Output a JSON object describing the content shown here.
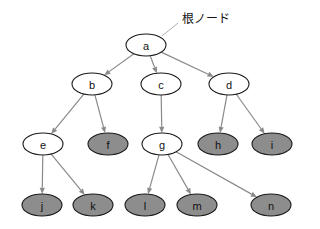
{
  "figure": {
    "kind": "tree-diagram",
    "width": 320,
    "height": 229,
    "background_color": "#ffffff"
  },
  "colors": {
    "node_outline": "#1a1a1a",
    "node_fill_white": "#ffffff",
    "node_fill_gray": "#8d8d8d",
    "edge": "#8a8a8a",
    "leader_line": "#a6a6a6",
    "text": "#111111"
  },
  "annotations": [
    {
      "id": "root-annotation",
      "text": "根ノード",
      "x": 182,
      "y": 20,
      "leader_from_x": 162,
      "leader_from_y": 36,
      "leader_to_x": 178,
      "leader_to_y": 23,
      "points_to_node": "a"
    }
  ],
  "nodes": [
    {
      "id": "a",
      "label": "a",
      "x": 146,
      "y": 45,
      "rx": 20,
      "ry": 11,
      "fill": "white",
      "level": 0
    },
    {
      "id": "b",
      "label": "b",
      "x": 92,
      "y": 84,
      "rx": 20,
      "ry": 11,
      "fill": "white",
      "level": 1
    },
    {
      "id": "c",
      "label": "c",
      "x": 161,
      "y": 84,
      "rx": 20,
      "ry": 11,
      "fill": "white",
      "level": 1
    },
    {
      "id": "d",
      "label": "d",
      "x": 229,
      "y": 84,
      "rx": 20,
      "ry": 11,
      "fill": "white",
      "level": 1
    },
    {
      "id": "e",
      "label": "e",
      "x": 43,
      "y": 144,
      "rx": 20,
      "ry": 11,
      "fill": "white",
      "level": 2
    },
    {
      "id": "f",
      "label": "f",
      "x": 108,
      "y": 144,
      "rx": 20,
      "ry": 11,
      "fill": "gray",
      "level": 2
    },
    {
      "id": "g",
      "label": "g",
      "x": 162,
      "y": 144,
      "rx": 20,
      "ry": 11,
      "fill": "white",
      "level": 2
    },
    {
      "id": "h",
      "label": "h",
      "x": 218,
      "y": 144,
      "rx": 20,
      "ry": 11,
      "fill": "gray",
      "level": 2
    },
    {
      "id": "i",
      "label": "i",
      "x": 272,
      "y": 144,
      "rx": 20,
      "ry": 11,
      "fill": "gray",
      "level": 2
    },
    {
      "id": "j",
      "label": "j",
      "x": 42,
      "y": 205,
      "rx": 20,
      "ry": 11,
      "fill": "gray",
      "level": 3
    },
    {
      "id": "k",
      "label": "k",
      "x": 93,
      "y": 205,
      "rx": 20,
      "ry": 11,
      "fill": "gray",
      "level": 3
    },
    {
      "id": "l",
      "label": "l",
      "x": 145,
      "y": 205,
      "rx": 20,
      "ry": 11,
      "fill": "gray",
      "level": 3
    },
    {
      "id": "m",
      "label": "m",
      "x": 197,
      "y": 205,
      "rx": 20,
      "ry": 11,
      "fill": "gray",
      "level": 3
    },
    {
      "id": "n",
      "label": "n",
      "x": 271,
      "y": 205,
      "rx": 20,
      "ry": 11,
      "fill": "gray",
      "level": 3
    }
  ],
  "edges": [
    {
      "id": "a-b",
      "from": "a",
      "to": "b",
      "directed": true
    },
    {
      "id": "a-c",
      "from": "a",
      "to": "c",
      "directed": true
    },
    {
      "id": "a-d",
      "from": "a",
      "to": "d",
      "directed": true
    },
    {
      "id": "b-e",
      "from": "b",
      "to": "e",
      "directed": true
    },
    {
      "id": "b-f",
      "from": "b",
      "to": "f",
      "directed": true
    },
    {
      "id": "c-g",
      "from": "c",
      "to": "g",
      "directed": true
    },
    {
      "id": "d-h",
      "from": "d",
      "to": "h",
      "directed": true
    },
    {
      "id": "d-i",
      "from": "d",
      "to": "i",
      "directed": true
    },
    {
      "id": "e-j",
      "from": "e",
      "to": "j",
      "directed": true
    },
    {
      "id": "e-k",
      "from": "e",
      "to": "k",
      "directed": true
    },
    {
      "id": "g-l",
      "from": "g",
      "to": "l",
      "directed": true
    },
    {
      "id": "g-m",
      "from": "g",
      "to": "m",
      "directed": true
    },
    {
      "id": "g-n",
      "from": "g",
      "to": "n",
      "directed": true
    }
  ]
}
